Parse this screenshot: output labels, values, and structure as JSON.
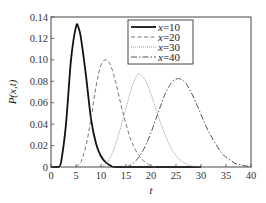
{
  "chart_data": {
    "type": "line",
    "title": "",
    "xlabel": "t",
    "ylabel": "P(x,t)",
    "xlim": [
      0,
      40
    ],
    "ylim": [
      0,
      0.14
    ],
    "grid": false,
    "legend_position": "upper-center-right",
    "xticks": [
      "0",
      "5",
      "10",
      "15",
      "20",
      "25",
      "30",
      "35",
      "40"
    ],
    "yticks": [
      "0",
      "0.02",
      "0.04",
      "0.06",
      "0.08",
      "0.10",
      "0.12",
      "0.14"
    ],
    "series": [
      {
        "name": "x=10",
        "style": "solid",
        "color": "#111111",
        "width": 1.8,
        "peak_t": 5.2,
        "peak_p": 0.132,
        "points": [
          [
            0,
            0
          ],
          [
            1.5,
            0.0
          ],
          [
            2,
            0.004
          ],
          [
            3,
            0.04
          ],
          [
            4,
            0.1
          ],
          [
            5,
            0.131
          ],
          [
            5.5,
            0.13
          ],
          [
            6,
            0.12
          ],
          [
            7,
            0.085
          ],
          [
            8,
            0.045
          ],
          [
            9,
            0.022
          ],
          [
            10,
            0.01
          ],
          [
            11,
            0.004
          ],
          [
            12,
            0.001
          ],
          [
            13,
            0
          ],
          [
            20,
            0
          ],
          [
            30,
            0
          ]
        ]
      },
      {
        "name": "x=20",
        "style": "dashed",
        "color": "#777777",
        "width": 1.0,
        "peak_t": 11,
        "peak_p": 0.1,
        "points": [
          [
            5,
            0
          ],
          [
            6,
            0.005
          ],
          [
            7,
            0.02
          ],
          [
            8,
            0.045
          ],
          [
            9,
            0.075
          ],
          [
            10,
            0.095
          ],
          [
            11,
            0.1
          ],
          [
            12,
            0.094
          ],
          [
            13,
            0.078
          ],
          [
            14,
            0.058
          ],
          [
            15,
            0.04
          ],
          [
            16,
            0.025
          ],
          [
            17,
            0.015
          ],
          [
            18,
            0.008
          ],
          [
            19,
            0.004
          ],
          [
            20,
            0.001
          ],
          [
            21,
            0
          ]
        ]
      },
      {
        "name": "x=30",
        "style": "dotted",
        "color": "#999999",
        "width": 1.0,
        "peak_t": 17.5,
        "peak_p": 0.087,
        "points": [
          [
            10,
            0
          ],
          [
            11,
            0.003
          ],
          [
            12,
            0.01
          ],
          [
            13,
            0.022
          ],
          [
            14,
            0.038
          ],
          [
            15,
            0.055
          ],
          [
            16,
            0.072
          ],
          [
            17,
            0.084
          ],
          [
            17.5,
            0.087
          ],
          [
            18,
            0.086
          ],
          [
            19,
            0.08
          ],
          [
            20,
            0.068
          ],
          [
            21,
            0.054
          ],
          [
            22,
            0.04
          ],
          [
            23,
            0.028
          ],
          [
            24,
            0.018
          ],
          [
            25,
            0.011
          ],
          [
            26,
            0.006
          ],
          [
            27,
            0.003
          ],
          [
            28,
            0.001
          ],
          [
            30,
            0
          ]
        ]
      },
      {
        "name": "x=40",
        "style": "dashdot",
        "color": "#555555",
        "width": 1.0,
        "peak_t": 25.5,
        "peak_p": 0.082,
        "points": [
          [
            15,
            0
          ],
          [
            16,
            0.002
          ],
          [
            17,
            0.006
          ],
          [
            18,
            0.012
          ],
          [
            19,
            0.021
          ],
          [
            20,
            0.032
          ],
          [
            21,
            0.045
          ],
          [
            22,
            0.058
          ],
          [
            23,
            0.07
          ],
          [
            24,
            0.078
          ],
          [
            25,
            0.082
          ],
          [
            26,
            0.082
          ],
          [
            27,
            0.078
          ],
          [
            28,
            0.07
          ],
          [
            29,
            0.06
          ],
          [
            30,
            0.049
          ],
          [
            31,
            0.038
          ],
          [
            32,
            0.029
          ],
          [
            33,
            0.021
          ],
          [
            34,
            0.014
          ],
          [
            35,
            0.009
          ],
          [
            36,
            0.006
          ],
          [
            37,
            0.003
          ],
          [
            38,
            0.002
          ],
          [
            39,
            0.001
          ],
          [
            40,
            0
          ]
        ]
      }
    ]
  }
}
